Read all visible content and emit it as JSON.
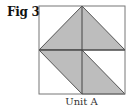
{
  "figure": {
    "label": "Fig 3",
    "caption": "Unit A"
  },
  "diagram": {
    "box": {
      "x": 39,
      "y": 6,
      "w": 86,
      "h": 88
    },
    "colors": {
      "stroke": "#555555",
      "fill": "#bdbdbd",
      "background": "#ffffff"
    },
    "shapes": [
      {
        "name": "upper-triangle",
        "points": "39,50 82,6 125,50"
      },
      {
        "name": "lower-parallelogram",
        "points": "39,50 82,50 125,94 82,94"
      }
    ]
  }
}
